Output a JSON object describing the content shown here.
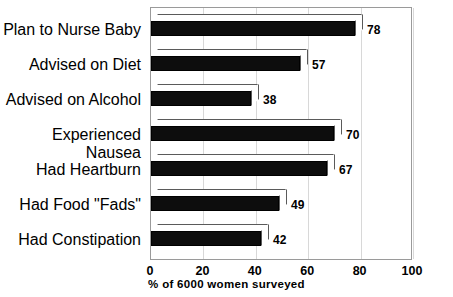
{
  "chart_data": {
    "type": "bar",
    "orientation": "horizontal",
    "title": "",
    "subtitle": "",
    "xlabel": "% of 6000 women surveyed",
    "ylabel": "",
    "xlim": [
      0,
      100
    ],
    "xticks": [
      0,
      20,
      40,
      60,
      80,
      100
    ],
    "xtick_labels": [
      "0",
      "20",
      "40",
      "60",
      "80",
      "100"
    ],
    "grid": true,
    "grid_axis": "x",
    "legend": false,
    "legend_position": "none",
    "categories": [
      "Plan to Nurse Baby",
      "Advised on Diet",
      "Advised on Alcohol",
      "Experienced Nausea",
      "Had Heartburn",
      "Had Food \"Fads\"",
      "Had Constipation"
    ],
    "values": [
      78,
      57,
      38,
      70,
      67,
      49,
      42
    ],
    "value_labels": [
      "78",
      "57",
      "38",
      "70",
      "67",
      "49",
      "42"
    ],
    "bar_style": "3d-extruded",
    "bar_face_color": "#0d0d0d",
    "bar_side_color": "#ffffff",
    "bar_edge_color": "#000000",
    "background_color": "#ffffff",
    "frame_color": "#9a9a9a",
    "gridline_color": "#d8d8d8"
  }
}
